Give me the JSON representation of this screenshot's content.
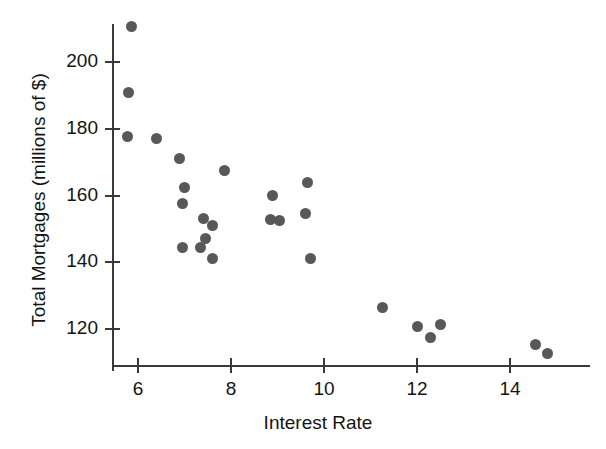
{
  "chart_data": {
    "type": "scatter",
    "title": "",
    "xlabel": "Interest Rate",
    "ylabel": "Total Mortgages (millions of $)",
    "xlim": [
      5.4,
      15.3
    ],
    "ylim": [
      110.0,
      213.5
    ],
    "xticks": [
      6,
      8,
      10,
      12,
      14
    ],
    "yticks": [
      120,
      140,
      160,
      180,
      200
    ],
    "xticklabels": [
      "6",
      "8",
      "10",
      "12",
      "14"
    ],
    "yticklabels": [
      "120",
      "140",
      "160",
      "180",
      "200"
    ],
    "grid": false,
    "legend": false,
    "marker": {
      "shape": "circle",
      "color": "#585858",
      "size": 11
    },
    "series": [
      {
        "name": "Mortgages vs Interest Rate",
        "points": [
          {
            "x": 5.85,
            "y": 210.6
          },
          {
            "x": 5.8,
            "y": 191.0
          },
          {
            "x": 5.78,
            "y": 177.6
          },
          {
            "x": 6.4,
            "y": 177.0
          },
          {
            "x": 6.9,
            "y": 171.0
          },
          {
            "x": 7.0,
            "y": 162.5
          },
          {
            "x": 6.95,
            "y": 157.5
          },
          {
            "x": 7.85,
            "y": 167.6
          },
          {
            "x": 7.4,
            "y": 153.2
          },
          {
            "x": 7.6,
            "y": 151.0
          },
          {
            "x": 7.45,
            "y": 147.0
          },
          {
            "x": 6.95,
            "y": 144.5
          },
          {
            "x": 7.35,
            "y": 144.4
          },
          {
            "x": 7.6,
            "y": 141.0
          },
          {
            "x": 8.9,
            "y": 160.0
          },
          {
            "x": 8.85,
            "y": 152.9
          },
          {
            "x": 9.05,
            "y": 152.6
          },
          {
            "x": 9.65,
            "y": 164.0
          },
          {
            "x": 9.6,
            "y": 154.5
          },
          {
            "x": 9.7,
            "y": 141.0
          },
          {
            "x": 11.25,
            "y": 126.5
          },
          {
            "x": 12.0,
            "y": 120.8
          },
          {
            "x": 12.3,
            "y": 117.5
          },
          {
            "x": 12.5,
            "y": 121.3
          },
          {
            "x": 14.55,
            "y": 115.5
          },
          {
            "x": 14.8,
            "y": 112.6
          }
        ]
      }
    ]
  }
}
